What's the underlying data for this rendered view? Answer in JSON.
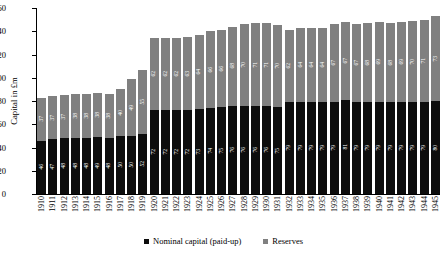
{
  "chart_data": {
    "type": "bar",
    "stacked": true,
    "title": "",
    "xlabel": "",
    "ylabel": "Capital in £m",
    "ylim": [
      0,
      160
    ],
    "ytick_step": 20,
    "yticks": [
      0,
      20,
      40,
      60,
      80,
      100,
      120,
      140,
      160
    ],
    "grid": false,
    "legend_position": "bottom-center",
    "categories": [
      "1910",
      "1911",
      "1912",
      "1913",
      "1914",
      "1915",
      "1916",
      "1917",
      "1918",
      "1919",
      "1920",
      "1921",
      "1922",
      "1923",
      "1924",
      "1925",
      "1926",
      "1927",
      "1928",
      "1929",
      "1930",
      "1931",
      "1932",
      "1933",
      "1934",
      "1935",
      "1936",
      "1937",
      "1938",
      "1939",
      "1940",
      "1941",
      "1942",
      "1943",
      "1944",
      "1945"
    ],
    "series": [
      {
        "name": "Nominal capital (paid-up)",
        "color": "#0d0d0d",
        "values": [
          46,
          47,
          48,
          48,
          48,
          49,
          48,
          50,
          50,
          52,
          72,
          72,
          72,
          72,
          73,
          74,
          75,
          76,
          76,
          76,
          76,
          75,
          79,
          79,
          79,
          79,
          79,
          81,
          79,
          79,
          79,
          79,
          79,
          79,
          79,
          80
        ]
      },
      {
        "name": "Reserves",
        "color": "#808080",
        "values": [
          37,
          37,
          37,
          38,
          38,
          38,
          38,
          40,
          49,
          55,
          62,
          62,
          62,
          63,
          64,
          66,
          66,
          68,
          70,
          71,
          71,
          70,
          62,
          64,
          64,
          64,
          67,
          67,
          67,
          68,
          69,
          68,
          69,
          70,
          71,
          73
        ]
      }
    ],
    "totals": [
      83,
      84,
      85,
      86,
      86,
      87,
      86,
      90,
      99,
      107,
      134,
      134,
      134,
      135,
      137,
      140,
      141,
      144,
      146,
      147,
      147,
      145,
      141,
      143,
      143,
      143,
      146,
      148,
      146,
      147,
      148,
      147,
      148,
      149,
      150,
      153
    ]
  },
  "legend": {
    "items": [
      {
        "label": "Nominal capital (paid-up)",
        "color": "#0d0d0d"
      },
      {
        "label": "Reserves",
        "color": "#808080"
      }
    ]
  }
}
